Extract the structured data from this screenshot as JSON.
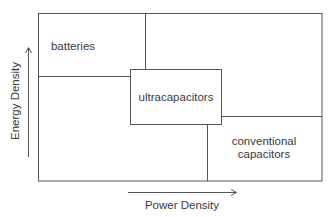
{
  "diagram": {
    "type": "ragone-style region diagram",
    "axes": {
      "x_label": "Power Density",
      "y_label": "Energy Density"
    },
    "regions": [
      {
        "id": "batteries",
        "label": "batteries"
      },
      {
        "id": "ultracapacitors",
        "label": "ultracapacitors"
      },
      {
        "id": "conventional-capacitors",
        "label_line1": "conventional",
        "label_line2": "capacitors"
      }
    ],
    "colors": {
      "line": "#555555",
      "text": "#3a3a3a",
      "background": "#ffffff"
    }
  }
}
